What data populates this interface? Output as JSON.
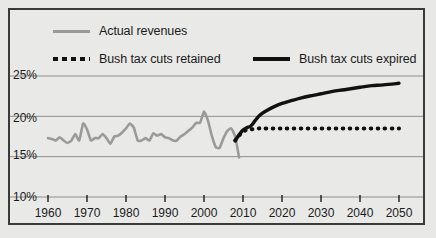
{
  "chart_data": {
    "type": "line",
    "title": "",
    "subtitle": "",
    "xlabel": "",
    "ylabel": "",
    "xlim": [
      1958,
      2052
    ],
    "ylim": [
      10,
      26.5
    ],
    "grid": true,
    "grid_axis": "y",
    "legend_position": "top",
    "yticks": [
      10,
      15,
      20,
      25
    ],
    "ytick_labels": [
      "10%",
      "15%",
      "20%",
      "25%"
    ],
    "xticks": [
      1960,
      1970,
      1980,
      1990,
      2000,
      2010,
      2020,
      2030,
      2040,
      2050
    ],
    "xtick_labels": [
      "1960",
      "1970",
      "1980",
      "1990",
      "2000",
      "2010",
      "2020",
      "2030",
      "2040",
      "2050"
    ],
    "series": [
      {
        "name": "Actual revenues",
        "style": "solid",
        "color": "#9a9a9a",
        "width": 2.6,
        "x": [
          1960,
          1961,
          1962,
          1963,
          1964,
          1965,
          1966,
          1967,
          1968,
          1969,
          1970,
          1971,
          1972,
          1973,
          1974,
          1975,
          1976,
          1977,
          1978,
          1979,
          1980,
          1981,
          1982,
          1983,
          1984,
          1985,
          1986,
          1987,
          1988,
          1989,
          1990,
          1991,
          1992,
          1993,
          1994,
          1995,
          1996,
          1997,
          1998,
          1999,
          2000,
          2001,
          2002,
          2003,
          2004,
          2005,
          2006,
          2007,
          2008,
          2009
        ],
        "values": [
          17.3,
          17.2,
          17.0,
          17.4,
          17.0,
          16.7,
          17.0,
          17.8,
          17.0,
          19.1,
          18.4,
          17.0,
          17.3,
          17.3,
          17.8,
          17.3,
          16.6,
          17.5,
          17.6,
          18.0,
          18.5,
          19.1,
          18.6,
          17.0,
          17.0,
          17.3,
          17.0,
          17.9,
          17.6,
          17.8,
          17.4,
          17.3,
          17.0,
          17.0,
          17.5,
          17.8,
          18.2,
          18.6,
          19.2,
          19.2,
          20.6,
          19.5,
          17.6,
          16.2,
          16.1,
          17.3,
          18.2,
          18.5,
          17.5,
          14.9
        ]
      },
      {
        "name": "Bush tax cuts retained",
        "style": "dotted",
        "color": "#111111",
        "width": 3.4,
        "x": [
          2008,
          2009,
          2010,
          2011,
          2012,
          2013,
          2014,
          2015,
          2020,
          2025,
          2030,
          2035,
          2040,
          2045,
          2050
        ],
        "values": [
          17.0,
          17.6,
          18.1,
          18.3,
          18.4,
          18.4,
          18.5,
          18.5,
          18.5,
          18.5,
          18.5,
          18.5,
          18.5,
          18.5,
          18.5
        ]
      },
      {
        "name": "Bush tax cuts expired",
        "style": "solid",
        "color": "#111111",
        "width": 3.4,
        "x": [
          2008,
          2009,
          2010,
          2011,
          2012,
          2013,
          2014,
          2015,
          2016,
          2018,
          2020,
          2022,
          2025,
          2028,
          2030,
          2033,
          2036,
          2040,
          2043,
          2046,
          2050
        ],
        "values": [
          17.0,
          17.7,
          18.3,
          18.6,
          18.8,
          19.4,
          20.0,
          20.4,
          20.7,
          21.2,
          21.6,
          21.9,
          22.3,
          22.6,
          22.8,
          23.1,
          23.3,
          23.6,
          23.8,
          23.9,
          24.1
        ]
      }
    ]
  },
  "legend": {
    "items": [
      {
        "label": "Actual revenues",
        "swatch": "solid-gray"
      },
      {
        "label": "Bush tax cuts retained",
        "swatch": "dotted-black"
      },
      {
        "label": "Bush tax cuts expired",
        "swatch": "solid-black"
      }
    ]
  },
  "axes": {
    "y_labels": [
      "25%",
      "20%",
      "15%",
      "10%"
    ],
    "x_labels": [
      "1960",
      "1970",
      "1980",
      "1990",
      "2000",
      "2010",
      "2020",
      "2030",
      "2040",
      "2050"
    ]
  },
  "colors": {
    "background": "#e8e8e6",
    "frame": "#3a3a3a",
    "actual_line": "#9a9a9a",
    "projection_line": "#111111",
    "gridline": "#8d8d8d",
    "text": "#1b1b1b"
  }
}
